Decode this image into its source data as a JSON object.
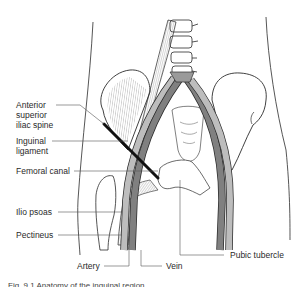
{
  "diagram": {
    "type": "anatomical-illustration",
    "colors": {
      "outline": "#2b2b2b",
      "artery": "#b9b9b9",
      "vein": "#7d7d7d",
      "ligament": "#111111",
      "bone_fill": "#ffffff",
      "muscle_hatch": "#555555",
      "leader": "#555555"
    },
    "labels": [
      {
        "id": "asis",
        "text_lines": [
          "Anterior",
          "superior",
          "iliac spine"
        ]
      },
      {
        "id": "inguinal",
        "text_lines": [
          "Inguinal",
          "ligament"
        ]
      },
      {
        "id": "femoral-canal",
        "text_lines": [
          "Femoral canal"
        ]
      },
      {
        "id": "ilio-psoas",
        "text_lines": [
          "Ilio psoas"
        ]
      },
      {
        "id": "pectineus",
        "text_lines": [
          "Pectineus"
        ]
      },
      {
        "id": "artery",
        "text_lines": [
          "Artery"
        ]
      },
      {
        "id": "vein",
        "text_lines": [
          "Vein"
        ]
      },
      {
        "id": "pubic-tubercle",
        "text_lines": [
          "Pubic tubercle"
        ]
      }
    ],
    "caption": "Fig. 9.1 Anatomy of the inguinal region"
  }
}
